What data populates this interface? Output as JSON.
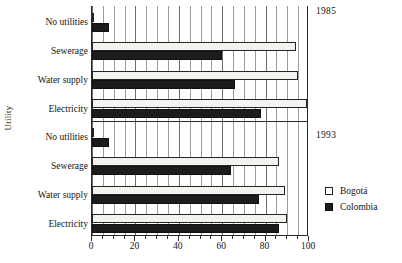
{
  "chart_data": {
    "type": "bar",
    "orientation": "horizontal",
    "title": "",
    "xlabel": "",
    "ylabel": "Utility",
    "xlim": [
      0,
      100
    ],
    "xticks": [
      0,
      20,
      40,
      60,
      80,
      100
    ],
    "xticklabels": [
      "0",
      "20",
      "40",
      "60",
      "80",
      "100"
    ],
    "grid": true,
    "minor_grid_step": 5,
    "legend_position": "right",
    "categories": [
      "No utilities",
      "Sewerage",
      "Water supply",
      "Electricity"
    ],
    "panels": [
      {
        "label": "1985",
        "categories": [
          "No utilities",
          "Sewerage",
          "Water supply",
          "Electricity"
        ],
        "series": [
          {
            "name": "Bogotá",
            "values": [
              1,
              94,
              95,
              99
            ]
          },
          {
            "name": "Colombia",
            "values": [
              8,
              60,
              66,
              78
            ]
          }
        ]
      },
      {
        "label": "1993",
        "categories": [
          "No utilities",
          "Sewerage",
          "Water supply",
          "Electricity"
        ],
        "series": [
          {
            "name": "Bogotá",
            "values": [
              1,
              86,
              89,
              90
            ]
          },
          {
            "name": "Colombia",
            "values": [
              8,
              64,
              77,
              86
            ]
          }
        ]
      }
    ],
    "series_colors": {
      "Bogotá": "#f2f2ee",
      "Colombia": "#1c1c1c"
    }
  },
  "axes": {
    "y_title": "Utility",
    "x_tick_labels": [
      "0",
      "20",
      "40",
      "60",
      "80",
      "100"
    ],
    "category_labels_1985": [
      "No utilities",
      "Sewerage",
      "Water supply",
      "Electricity"
    ],
    "category_labels_1993": [
      "No utilities",
      "Sewerage",
      "Water supply",
      "Electricity"
    ]
  },
  "annotations": {
    "year_top": "1985",
    "year_bottom": "1993"
  },
  "legend": {
    "items": [
      {
        "label": "Bogotá",
        "swatch": "open-square-swatch"
      },
      {
        "label": "Colombia",
        "swatch": "filled-square-swatch"
      }
    ]
  },
  "caption": {
    "remnant": ""
  }
}
